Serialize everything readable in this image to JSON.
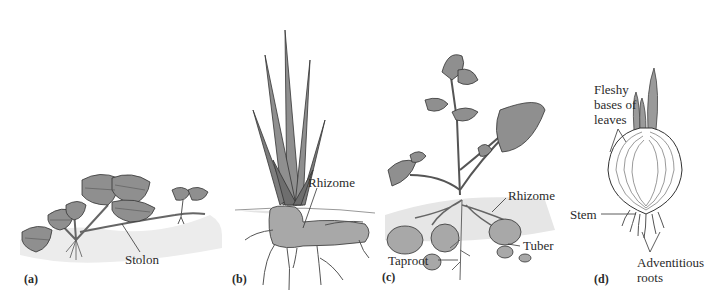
{
  "figure": {
    "colors": {
      "leaf": "#8f8f8f",
      "leaf_vein": "#5a5a5a",
      "outline": "#3a3a3a",
      "soil": "#e6e6e6",
      "tuber": "#a8a8a8",
      "root": "#f2f2f2",
      "onion_fill": "#ffffff",
      "onion_shoot": "#9a9a9a"
    },
    "panels": [
      {
        "id": "a",
        "panel_label": "(a)",
        "subject": "strawberry",
        "labels": {
          "stolon": "Stolon"
        }
      },
      {
        "id": "b",
        "panel_label": "(b)",
        "subject": "iris",
        "labels": {
          "rhizome": "Rhizome"
        }
      },
      {
        "id": "c",
        "panel_label": "(c)",
        "subject": "potato",
        "labels": {
          "rhizome": "Rhizome",
          "tuber": "Tuber",
          "taproot": "Taproot"
        }
      },
      {
        "id": "d",
        "panel_label": "(d)",
        "subject": "onion",
        "labels": {
          "fleshy_line1": "Fleshy",
          "fleshy_line2": "bases of",
          "fleshy_line3": "leaves",
          "stem": "Stem",
          "adventitious_line1": "Adventitious",
          "adventitious_line2": "roots"
        }
      }
    ]
  }
}
